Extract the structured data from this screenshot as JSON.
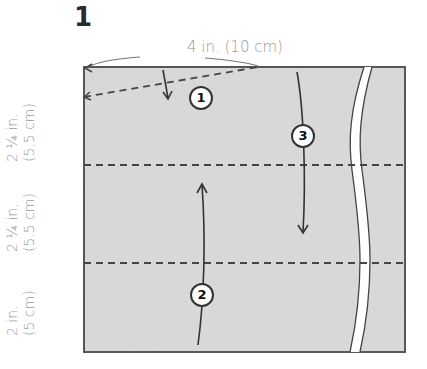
{
  "step": {
    "number": "1"
  },
  "dimensions": {
    "top": "4 in. (10 cm)",
    "left": [
      {
        "line1": "2 ¼ in.",
        "line2": "(5.5 cm)"
      },
      {
        "line1": "2 ¼ in.",
        "line2": "(5.5 cm)"
      },
      {
        "line1": "2 in.",
        "line2": "(5 cm)"
      }
    ]
  },
  "fold_markers": [
    "1",
    "2",
    "3"
  ],
  "colors": {
    "paper": "#d9d9d9",
    "outline": "#444444",
    "label": "#9a9a9a"
  }
}
